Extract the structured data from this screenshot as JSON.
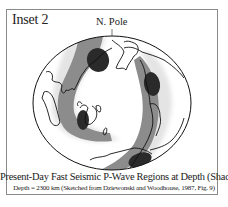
{
  "figure": {
    "inset_label": "Inset 2",
    "pole_label": "N. Pole",
    "caption_title": "Present-Day Fast Seismic P-Wave Regions at Depth (Shaded)",
    "caption_subtitle": "Depth = 2300 km (Sketched from Dziewonski and Woodhouse, 1987, Fig. 9)",
    "colors": {
      "frame": "#8a8a8a",
      "light_shade": "#e6e6e6",
      "mid_shade": "#8c8c8c",
      "dark_shade": "#2a2a2a",
      "outline": "#111111"
    },
    "depth_km": 2300,
    "source": "Dziewonski and Woodhouse, 1987, Fig. 9"
  }
}
